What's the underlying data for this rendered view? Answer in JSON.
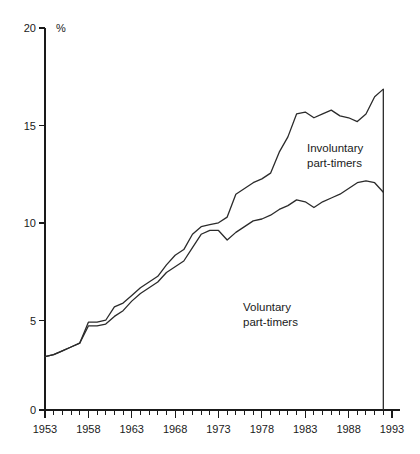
{
  "chart_data": {
    "type": "line",
    "title": "",
    "subtitle": "",
    "xlabel": "",
    "ylabel": "%",
    "unit_label": "%",
    "xlim": [
      1953,
      1993
    ],
    "ylim": [
      0,
      20
    ],
    "grid": false,
    "legend_position": "inline-annotations",
    "x_tick_labels": [
      "1953",
      "1958",
      "1963",
      "1968",
      "1973",
      "1978",
      "1983",
      "1988",
      "1993"
    ],
    "x_major_ticks": [
      1953,
      1958,
      1963,
      1968,
      1973,
      1978,
      1983,
      1988,
      1993
    ],
    "x_minor_tick_step": 1,
    "y_tick_labels": [
      "0",
      "5",
      "10",
      "15",
      "20"
    ],
    "y_ticks": [
      0,
      5,
      10,
      15,
      20
    ],
    "x": [
      1953,
      1954,
      1955,
      1956,
      1957,
      1958,
      1959,
      1960,
      1961,
      1962,
      1963,
      1964,
      1965,
      1966,
      1967,
      1968,
      1969,
      1970,
      1971,
      1972,
      1973,
      1974,
      1975,
      1976,
      1977,
      1978,
      1979,
      1980,
      1981,
      1982,
      1983,
      1984,
      1985,
      1986,
      1987,
      1988,
      1989,
      1990,
      1991,
      1992
    ],
    "series": [
      {
        "name": "Involuntary part-timers",
        "label": "Involuntary\npart-timers",
        "label_line1": "Involuntary",
        "label_line2": "part-timers",
        "description": "Upper curve: total including involuntary part-timers",
        "color": "#2b2b2b",
        "values": [
          2.8,
          2.9,
          3.1,
          3.3,
          3.5,
          4.6,
          4.6,
          4.7,
          5.4,
          5.6,
          6.0,
          6.4,
          6.7,
          7.0,
          7.6,
          8.1,
          8.4,
          9.2,
          9.6,
          9.7,
          9.8,
          10.1,
          11.3,
          11.6,
          11.9,
          12.1,
          12.4,
          13.5,
          14.3,
          15.5,
          15.6,
          15.3,
          15.5,
          15.7,
          15.4,
          15.3,
          15.1,
          15.5,
          16.4,
          16.8
        ]
      },
      {
        "name": "Voluntary part-timers",
        "label": "Voluntary\npart-timers",
        "label_line1": "Voluntary",
        "label_line2": "part-timers",
        "description": "Lower curve: voluntary part-timers",
        "color": "#2b2b2b",
        "values": [
          2.8,
          2.9,
          3.1,
          3.3,
          3.5,
          4.4,
          4.4,
          4.5,
          4.9,
          5.2,
          5.7,
          6.1,
          6.4,
          6.7,
          7.2,
          7.5,
          7.8,
          8.5,
          9.2,
          9.4,
          9.4,
          8.9,
          9.3,
          9.6,
          9.9,
          10.0,
          10.2,
          10.5,
          10.7,
          11.0,
          10.9,
          10.6,
          10.9,
          11.1,
          11.3,
          11.6,
          11.9,
          12.0,
          11.9,
          11.4
        ]
      }
    ]
  },
  "annotations": {
    "involuntary": {
      "line1": "Involuntary",
      "line2": "part-timers",
      "x": 307,
      "y": 149
    },
    "voluntary": {
      "line1": "Voluntary",
      "line2": "part-timers",
      "x": 243,
      "y": 308
    }
  },
  "axes": {
    "y_unit": "%"
  }
}
